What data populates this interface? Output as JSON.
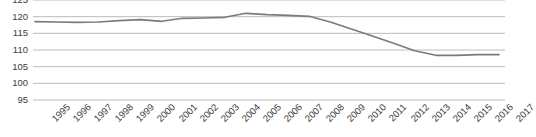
{
  "chart_data": {
    "type": "line",
    "title": "",
    "subtitle": "",
    "xlabel": "",
    "ylabel": "",
    "categories": [
      "1995",
      "1996",
      "1997",
      "1998",
      "1999",
      "2000",
      "2001",
      "2002",
      "2003",
      "2004",
      "2005",
      "2006",
      "2007",
      "2008",
      "2009",
      "2010",
      "2011",
      "2012",
      "2013",
      "2014",
      "2015",
      "2016",
      "2017"
    ],
    "values": [
      118.5,
      118.4,
      118.3,
      118.4,
      118.8,
      119.1,
      118.6,
      119.5,
      119.6,
      119.8,
      121.0,
      120.6,
      120.4,
      120.1,
      118.4,
      116.3,
      114.2,
      112.0,
      109.8,
      108.4,
      108.4,
      108.6,
      108.6
    ],
    "series": [
      {
        "name": "index",
        "color": "#7a7a7a",
        "values": [
          118.5,
          118.4,
          118.3,
          118.4,
          118.8,
          119.1,
          118.6,
          119.5,
          119.6,
          119.8,
          121.0,
          120.6,
          120.4,
          120.1,
          118.4,
          116.3,
          114.2,
          112.0,
          109.8,
          108.4,
          108.4,
          108.6,
          108.6
        ]
      }
    ],
    "ylim": [
      95,
      125
    ],
    "ytick_values": [
      95,
      100,
      105,
      110,
      115,
      120,
      125
    ],
    "ytick_labels": [
      "95",
      "100",
      "105",
      "110",
      "115",
      "120",
      "125"
    ],
    "ytick_step": 5,
    "grid": true,
    "grid_axis": "y",
    "grid_color": "#b4b4b4",
    "legend": false,
    "legend_position": "none",
    "annotations": [],
    "xtick_rotation": -45,
    "axis_text_color": "#3c3c3c",
    "background_color": "#ffffff"
  }
}
